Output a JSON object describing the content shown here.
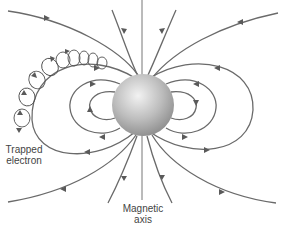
{
  "figure": {
    "labels": {
      "trapped_electron": [
        "Trapped",
        "electron"
      ],
      "magnetic_axis": [
        "Magnetic",
        "axis"
      ]
    },
    "colors": {
      "field_line": "#6a6a6a",
      "sphere_light": "#f0f0f0",
      "sphere_dark": "#8c8c8c",
      "text": "#444444"
    }
  }
}
